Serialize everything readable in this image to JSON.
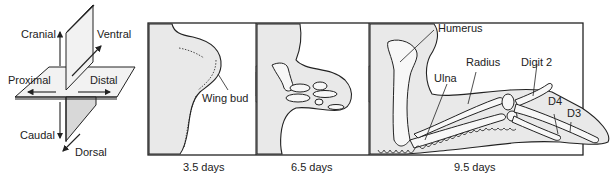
{
  "axes_diagram": {
    "labels": {
      "cranial": "Cranial",
      "ventral": "Ventral",
      "proximal": "Proximal",
      "distal": "Distal",
      "caudal": "Caudal",
      "dorsal": "Dorsal"
    }
  },
  "panels": [
    {
      "id": "stage-1",
      "caption": "3.5 days",
      "labels": {
        "wing_bud": "Wing bud"
      }
    },
    {
      "id": "stage-2",
      "caption": "6.5 days",
      "labels": {}
    },
    {
      "id": "stage-3",
      "caption": "9.5 days",
      "labels": {
        "humerus": "Humerus",
        "radius": "Radius",
        "ulna": "Ulna",
        "digit2": "Digit 2",
        "d4": "D4",
        "d3": "D3"
      }
    }
  ],
  "colors": {
    "tissue": "#e9e9e9",
    "line": "#222222",
    "arrow_dark": "#8a8a8a",
    "arrow_light": "#d0d0d0"
  }
}
